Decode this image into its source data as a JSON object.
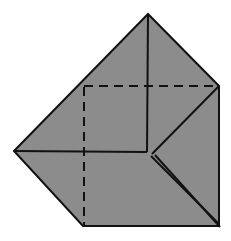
{
  "figure": {
    "canvas": {
      "width": 231,
      "height": 241
    },
    "colors": {
      "background": "#ffffff",
      "paper_fill": "#8c8c8c",
      "stroke": "#111111",
      "dashed_stroke": "#111111"
    },
    "stroke_widths": {
      "outline": 2.0,
      "crease": 2.0,
      "dashed": 2.0
    },
    "dash_pattern": "9 6",
    "shapes": {
      "outline_polygon": {
        "name": "paper-outline",
        "points": "14,151 148,14 219,86 219,226 83,226"
      },
      "solid_creases": [
        {
          "name": "apex-vertical-crease",
          "x1": 148,
          "y1": 14,
          "x2": 147,
          "y2": 152
        },
        {
          "name": "left-horizontal-crease",
          "x1": 14,
          "y1": 151,
          "x2": 147,
          "y2": 152
        },
        {
          "name": "right-diagonal-crease",
          "x1": 219,
          "y1": 86,
          "x2": 152,
          "y2": 154
        },
        {
          "name": "sliver-upper-edge",
          "x1": 151,
          "y1": 156,
          "x2": 219,
          "y2": 224
        },
        {
          "name": "sliver-lower-edge",
          "x1": 155,
          "y1": 155,
          "x2": 220,
          "y2": 227
        }
      ],
      "dashed_creases": [
        {
          "name": "horizontal-hidden-crease",
          "x1": 84,
          "y1": 86,
          "x2": 218,
          "y2": 86
        },
        {
          "name": "vertical-hidden-crease",
          "x1": 84,
          "y1": 87,
          "x2": 84,
          "y2": 226
        }
      ]
    }
  }
}
